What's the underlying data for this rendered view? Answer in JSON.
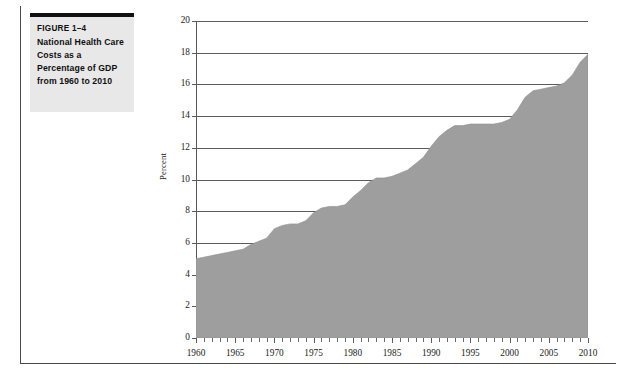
{
  "figure": {
    "number_label": "FIGURE 1–4",
    "title": "National Health Care Costs as a Percentage of GDP from 1960 to 2010"
  },
  "chart_data": {
    "type": "area",
    "title": "",
    "xlabel": "",
    "ylabel": "Percent",
    "xlim": [
      1960,
      2010
    ],
    "ylim": [
      0,
      20
    ],
    "grid": true,
    "legend_position": "none",
    "fill_color": "#9e9e9e",
    "axis_color": "#555555",
    "y_ticks": [
      0,
      2,
      4,
      6,
      8,
      10,
      12,
      14,
      16,
      18,
      20
    ],
    "y_tick_labels": [
      "0",
      "2",
      "4",
      "6",
      "8",
      "10",
      "12",
      "14",
      "16",
      "18",
      "20"
    ],
    "x_ticks": [
      1960,
      1965,
      1970,
      1975,
      1980,
      1985,
      1990,
      1995,
      2000,
      2005,
      2010
    ],
    "x_tick_labels": [
      "1960",
      "1965",
      "1970",
      "1975",
      "1980",
      "1985",
      "1990",
      "1995",
      "2000",
      "2005",
      "2010"
    ],
    "x_minor_tick_step": 1,
    "x": [
      1960,
      1961,
      1962,
      1963,
      1964,
      1965,
      1966,
      1967,
      1968,
      1969,
      1970,
      1971,
      1972,
      1973,
      1974,
      1975,
      1976,
      1977,
      1978,
      1979,
      1980,
      1981,
      1982,
      1983,
      1984,
      1985,
      1986,
      1987,
      1988,
      1989,
      1990,
      1991,
      1992,
      1993,
      1994,
      1995,
      1996,
      1997,
      1998,
      1999,
      2000,
      2001,
      2002,
      2003,
      2004,
      2005,
      2006,
      2007,
      2008,
      2009,
      2010
    ],
    "values": [
      5.0,
      5.1,
      5.2,
      5.3,
      5.4,
      5.5,
      5.6,
      5.9,
      6.1,
      6.3,
      6.9,
      7.1,
      7.2,
      7.2,
      7.4,
      7.9,
      8.2,
      8.3,
      8.3,
      8.4,
      8.9,
      9.3,
      9.8,
      10.1,
      10.1,
      10.2,
      10.4,
      10.6,
      11.0,
      11.4,
      12.1,
      12.7,
      13.1,
      13.4,
      13.4,
      13.5,
      13.5,
      13.5,
      13.5,
      13.6,
      13.8,
      14.4,
      15.2,
      15.6,
      15.7,
      15.8,
      15.9,
      16.1,
      16.6,
      17.4,
      17.9
    ],
    "source_note": ""
  }
}
